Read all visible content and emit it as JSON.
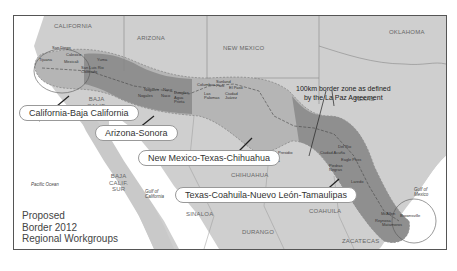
{
  "map": {
    "title_lines": [
      "Proposed",
      "Border 2012",
      "Regional Workgroups"
    ],
    "annotation_lines": [
      "100km border zone as defined",
      "by the La Paz Agreement"
    ],
    "states": {
      "california": "CALIFORNIA",
      "arizona": "ARIZONA",
      "new_mexico": "NEW MEXICO",
      "oklahoma": "OKLAHOMA",
      "texas": "TEXAS",
      "baja_calif": [
        "BAJA",
        "CALIF."
      ],
      "baja_calif_sur": [
        "BAJA",
        "CALIF.",
        "SUR"
      ],
      "sonora": "SONORA",
      "chihuahua": "CHIHUAHUA",
      "coahuila": "COAHUILA",
      "sinaloa": "SINALOA",
      "durango": "DURANGO",
      "nuevo_leon": [
        "NUEVO",
        "LEÓN"
      ],
      "tamaulipas": "TAMAULIPAS",
      "zacatecas": "ZACATECAS"
    },
    "water": {
      "pacific": "Pacific Ocean",
      "gulf_california": [
        "Gulf of",
        "California"
      ],
      "gulf_mexico": [
        "Gulf of",
        "Mexico"
      ]
    },
    "cities": [
      {
        "name": "San Diego"
      },
      {
        "name": "Tijuana"
      },
      {
        "name": "Calexico"
      },
      {
        "name": "Mexicali"
      },
      {
        "name": "Yuma"
      },
      {
        "name": "San Luis Rio Colorado"
      },
      {
        "name": "Nogales"
      },
      {
        "name": "Nogales"
      },
      {
        "name": "Naco"
      },
      {
        "name": "Naco"
      },
      {
        "name": "Douglas"
      },
      {
        "name": "Agua Prieta"
      },
      {
        "name": "Columbus"
      },
      {
        "name": "Las Palomas"
      },
      {
        "name": "Sunland Park"
      },
      {
        "name": "El Paso"
      },
      {
        "name": "Ciudad Juárez"
      },
      {
        "name": "Presidio"
      },
      {
        "name": "Ojinaga"
      },
      {
        "name": "Del Rio"
      },
      {
        "name": "Ciudad Acuña"
      },
      {
        "name": "Eagle Pass"
      },
      {
        "name": "Piedras Negras"
      },
      {
        "name": "Laredo"
      },
      {
        "name": "Nuevo Laredo"
      },
      {
        "name": "McAllen"
      },
      {
        "name": "Reynosa"
      },
      {
        "name": "Brownsville"
      },
      {
        "name": "Matamoros"
      }
    ],
    "workgroups": [
      {
        "label": "California-Baja California"
      },
      {
        "label": "Arizona-Sonora"
      },
      {
        "label": "New Mexico-Texas-Chihuahua"
      },
      {
        "label": "Texas-Coahuila-Nuevo León-Tamaulipas"
      }
    ],
    "colors": {
      "land": "#c9c9c9",
      "zone_light": "#b3b3b3",
      "zone_dark": "#8e8e8e",
      "water": "#ffffff",
      "border_line": "#555555"
    }
  }
}
